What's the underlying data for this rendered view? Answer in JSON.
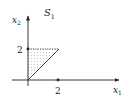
{
  "diagram": {
    "title": "S",
    "title_sub": "1",
    "x_axis": {
      "label": "x",
      "label_sub": "1",
      "tick_label": "2"
    },
    "y_axis": {
      "label": "x",
      "label_sub": "2",
      "tick_label": "2"
    },
    "region": {
      "shape": "triangle",
      "vertices": [
        [
          0,
          0
        ],
        [
          0,
          2
        ],
        [
          2,
          2
        ]
      ],
      "fill": "dotted",
      "top_edge": "dotted",
      "other_edges": "solid"
    },
    "colors": {
      "ink": "#222222",
      "background": "#ffffff",
      "fill_dots": "#888888"
    }
  }
}
